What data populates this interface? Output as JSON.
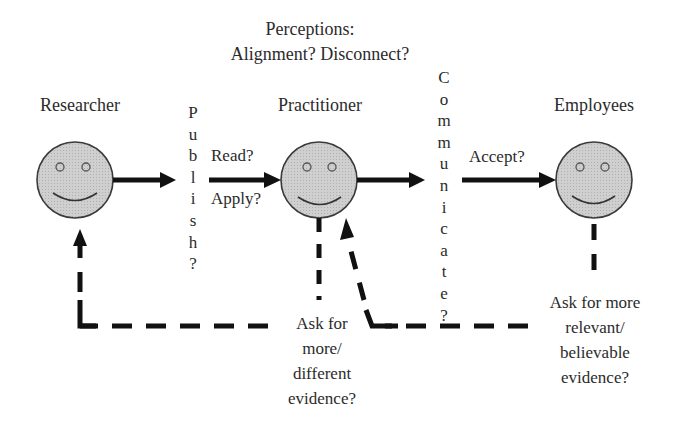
{
  "title": {
    "line1": "Perceptions:",
    "line2": "Alignment? Disconnect?"
  },
  "actors": [
    {
      "id": "researcher",
      "label": "Researcher"
    },
    {
      "id": "practitioner",
      "label": "Practitioner"
    },
    {
      "id": "employees",
      "label": "Employees"
    }
  ],
  "flows": {
    "publish": {
      "letters": [
        "P",
        "u",
        "b",
        "l",
        "i",
        "s",
        "h",
        "?"
      ]
    },
    "communicate": {
      "letters": [
        "C",
        "o",
        "m",
        "m",
        "u",
        "n",
        "i",
        "c",
        "a",
        "t",
        "e",
        "?"
      ]
    },
    "read": "Read?",
    "apply": "Apply?",
    "accept": "Accept?"
  },
  "feedback": {
    "practitioner_to_researcher": [
      "Ask for",
      "more/",
      "different",
      "evidence?"
    ],
    "employees_to_practitioner": [
      "Ask for more",
      "relevant/",
      "believable",
      "evidence?"
    ]
  },
  "colors": {
    "face_fill": "#c9c9c9",
    "face_stroke": "#3a3a3a",
    "arrow": "#111111",
    "text": "#2b2b2b"
  }
}
